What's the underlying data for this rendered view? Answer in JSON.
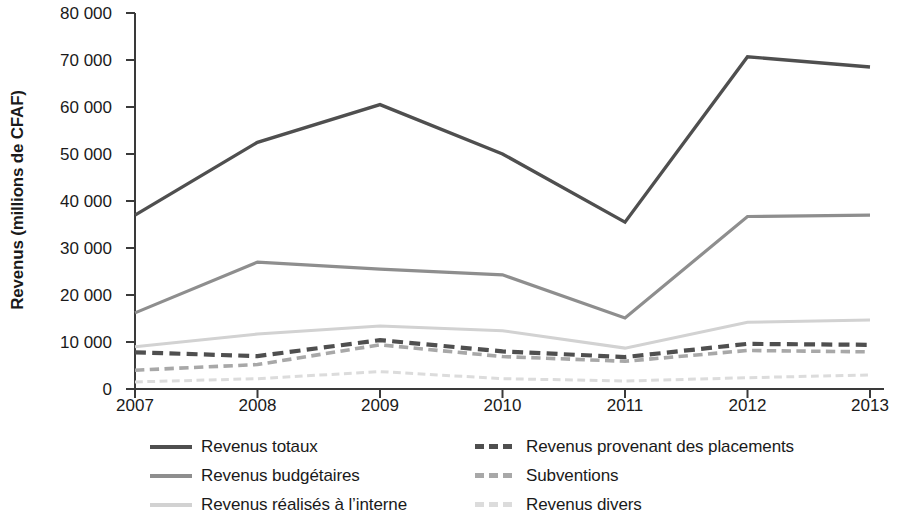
{
  "chart_data": {
    "type": "line",
    "title": "",
    "xlabel": "",
    "ylabel": "Revenus  (millions de CFAF)",
    "categories": [
      "2007",
      "2008",
      "2009",
      "2010",
      "2011",
      "2012",
      "2013"
    ],
    "x": [
      2007,
      2008,
      2009,
      2010,
      2011,
      2012,
      2013
    ],
    "ylim": [
      0,
      80000
    ],
    "ytick_labels": [
      "0",
      "10 000",
      "20 000",
      "30 000",
      "40 000",
      "50 000",
      "60 000",
      "70 000",
      "80 000"
    ],
    "ytick_values": [
      0,
      10000,
      20000,
      30000,
      40000,
      50000,
      60000,
      70000,
      80000
    ],
    "grid": false,
    "legend_position": "bottom",
    "legend_columns": 2,
    "series": [
      {
        "name": "Revenus totaux",
        "values": [
          37000,
          52500,
          60500,
          50000,
          35500,
          70700,
          68500
        ],
        "color": "#4f4f4f",
        "style": "solid",
        "width": 3.4
      },
      {
        "name": "Revenus budgétaires",
        "values": [
          16200,
          27000,
          25500,
          24300,
          15100,
          36700,
          37000
        ],
        "color": "#8e8e8e",
        "style": "solid",
        "width": 3.2
      },
      {
        "name": "Revenus réalisés à l’interne",
        "values": [
          9000,
          11700,
          13400,
          12400,
          8700,
          14200,
          14700
        ],
        "color": "#d2d2d2",
        "style": "solid",
        "width": 3.0
      },
      {
        "name": "Revenus provenant des placements",
        "values": [
          7800,
          7000,
          10400,
          8000,
          6800,
          9600,
          9400
        ],
        "color": "#4f4f4f",
        "style": "dashed",
        "width": 4.2
      },
      {
        "name": "Subventions",
        "values": [
          4000,
          5200,
          9400,
          6900,
          5900,
          8200,
          7900
        ],
        "color": "#a8a8a8",
        "style": "dashed",
        "width": 3.6
      },
      {
        "name": "Revenus divers",
        "values": [
          1500,
          2200,
          3700,
          2200,
          1700,
          2400,
          3000
        ],
        "color": "#dcdcdc",
        "style": "dashed",
        "width": 3.0
      }
    ],
    "axis_color": "#3a3a3a"
  }
}
